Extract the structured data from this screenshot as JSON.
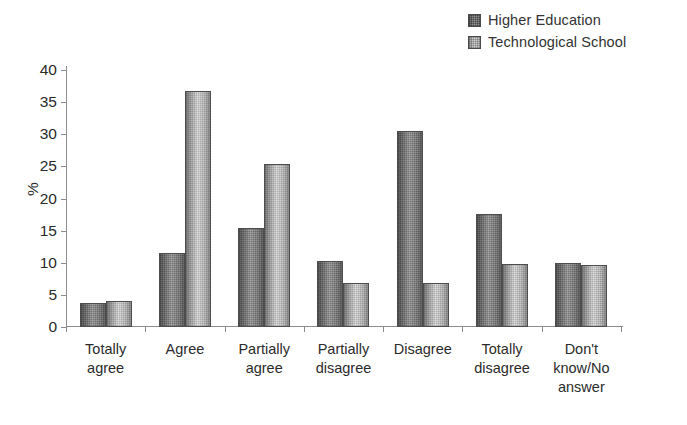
{
  "chart_data": {
    "type": "bar",
    "title": "",
    "subtitle": "",
    "xlabel": "",
    "ylabel": "%",
    "ylim": [
      0,
      40
    ],
    "ytick_step": 5,
    "yticks": [
      0,
      5,
      10,
      15,
      20,
      25,
      30,
      35,
      40
    ],
    "ytick_labels": [
      "0",
      "5",
      "10",
      "15",
      "20",
      "25",
      "30",
      "35",
      "40"
    ],
    "grid": false,
    "legend_position": "top-right",
    "categories": [
      "Totally agree",
      "Agree",
      "Partially agree",
      "Partially disagree",
      "Disagree",
      "Totally disagree",
      "Don't know/No answer"
    ],
    "category_lines": [
      [
        "Totally",
        "agree"
      ],
      [
        "Agree"
      ],
      [
        "Partially",
        "agree"
      ],
      [
        "Partially",
        "disagree"
      ],
      [
        "Disagree"
      ],
      [
        "Totally",
        "disagree"
      ],
      [
        "Don't",
        "know/No",
        "answer"
      ]
    ],
    "series": [
      {
        "name": "Higher Education",
        "color": "#8f8f8f",
        "values": [
          3.7,
          11.5,
          15.4,
          10.2,
          30.5,
          17.6,
          10.0
        ]
      },
      {
        "name": "Technological School",
        "color": "#d0d0d0",
        "values": [
          4.1,
          36.8,
          25.3,
          6.9,
          6.9,
          9.8,
          9.7
        ]
      }
    ]
  },
  "legend": {
    "items": [
      {
        "label": "Higher Education"
      },
      {
        "label": "Technological School"
      }
    ]
  },
  "axis": {
    "y_title": "%"
  }
}
